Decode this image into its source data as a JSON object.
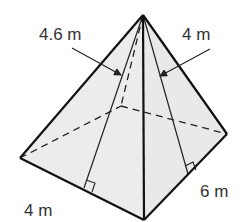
{
  "diagram": {
    "type": "square-based pyramid (rectangular base)",
    "labels": {
      "slant_left": "4.6 m",
      "slant_right": "4 m",
      "base_front_left": "4 m",
      "base_front_right": "6 m"
    },
    "colors": {
      "face_fill": "#ececec",
      "edge": "#111111",
      "text": "#333333"
    }
  }
}
